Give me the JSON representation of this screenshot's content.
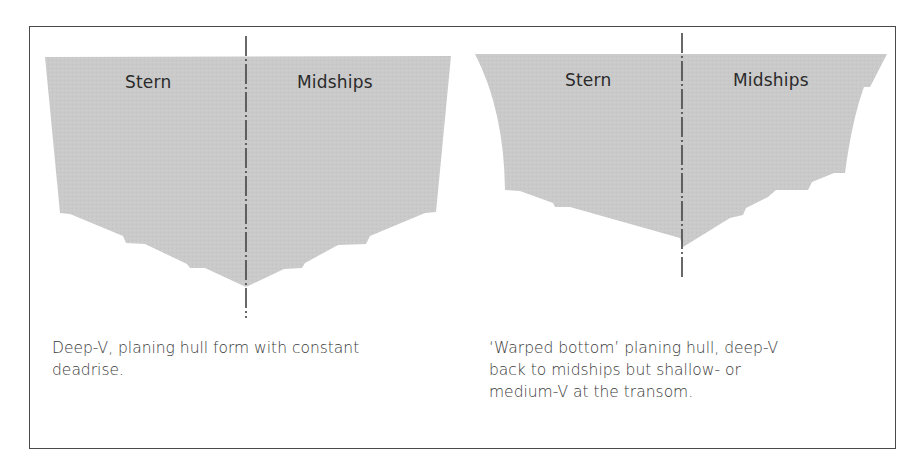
{
  "figure": {
    "panels": [
      {
        "id": "deep-v",
        "labels": {
          "left": "Stern",
          "right": "Midships"
        },
        "caption_lines": [
          "Deep-V, planing hull form with constant",
          "deadrise."
        ]
      },
      {
        "id": "warped-bottom",
        "labels": {
          "left": "Stern",
          "right": "Midships"
        },
        "caption_lines": [
          "‘Warped bottom’ planing hull, deep-V",
          "back to midships but shallow- or",
          "medium-V at the transom."
        ]
      }
    ],
    "colors": {
      "hull_fill": "#c9c9c9",
      "centerline": "#444444",
      "frame_border": "#4a4a4a",
      "text": "#2a2a2a"
    }
  }
}
